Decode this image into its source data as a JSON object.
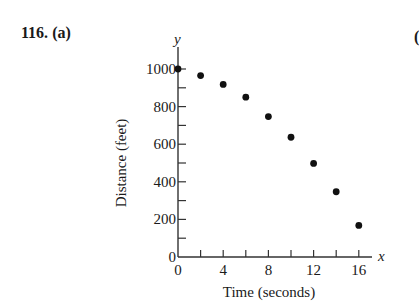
{
  "problem": {
    "number": "116.",
    "part": "(a)",
    "next_part_glyph": "("
  },
  "chart_data": {
    "type": "scatter",
    "title": "",
    "xlabel": "Time (seconds)",
    "ylabel": "Distance (feet)",
    "x_axis_var": "x",
    "y_axis_var": "y",
    "xlim": [
      0,
      17
    ],
    "ylim": [
      0,
      1050
    ],
    "x_ticks": [
      0,
      2,
      4,
      6,
      8,
      10,
      12,
      14,
      16
    ],
    "x_tick_labels": [
      "0",
      "4",
      "8",
      "12",
      "16"
    ],
    "y_ticks": [
      0,
      100,
      200,
      300,
      400,
      500,
      600,
      700,
      800,
      900,
      1000
    ],
    "y_tick_labels": [
      "0",
      "200",
      "400",
      "600",
      "800",
      "1000"
    ],
    "grid": false,
    "legend": null,
    "series": [
      {
        "name": "Distance",
        "x": [
          0,
          2,
          4,
          6,
          8,
          10,
          12,
          14,
          16
        ],
        "y": [
          1000,
          965,
          918,
          850,
          747,
          637,
          498,
          347,
          168
        ],
        "color": "#111111",
        "marker": "circle"
      }
    ]
  }
}
